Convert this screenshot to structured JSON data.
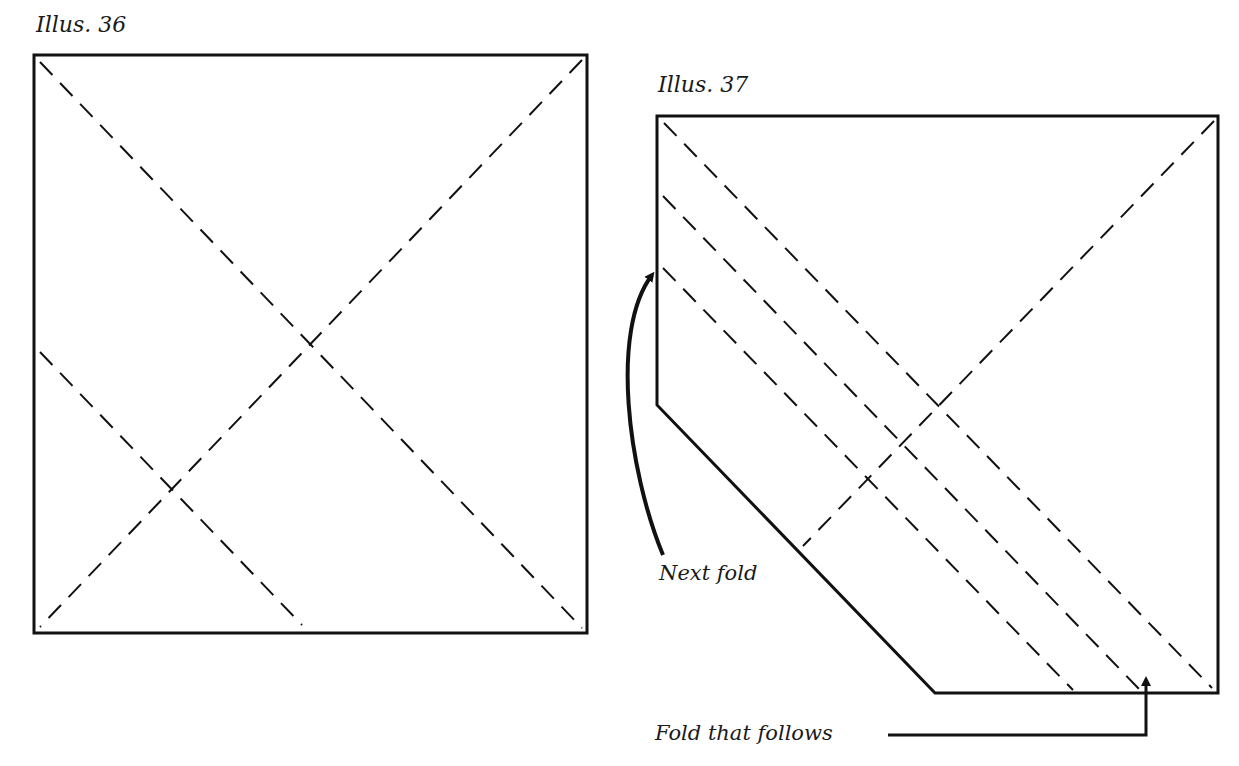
{
  "figures": [
    {
      "id": "illus-36",
      "title": "Illus. 36",
      "shape": "square",
      "outline": [
        [
          34,
          55
        ],
        [
          587,
          55
        ],
        [
          587,
          633
        ],
        [
          34,
          633
        ]
      ],
      "fold_lines": [
        {
          "type": "dashed",
          "from": [
            40,
            62
          ],
          "to": [
            582,
            628
          ]
        },
        {
          "type": "dashed",
          "from": [
            582,
            60
          ],
          "to": [
            40,
            627
          ]
        },
        {
          "type": "dashed",
          "from": [
            40,
            352
          ],
          "to": [
            302,
            625
          ]
        }
      ]
    },
    {
      "id": "illus-37",
      "title": "Illus. 37",
      "shape": "pentagon (square with folded corner)",
      "outline": [
        [
          657,
          116
        ],
        [
          1218,
          116
        ],
        [
          1218,
          693
        ],
        [
          935,
          693
        ],
        [
          657,
          405
        ]
      ],
      "fold_lines": [
        {
          "type": "dashed",
          "from": [
            664,
            123
          ],
          "to": [
            1212,
            688
          ]
        },
        {
          "type": "dashed",
          "from": [
            1214,
            121
          ],
          "to": [
            803,
            546
          ]
        },
        {
          "type": "dashed",
          "from": [
            663,
            196
          ],
          "to": [
            1140,
            690
          ]
        },
        {
          "type": "dashed",
          "from": [
            663,
            268
          ],
          "to": [
            1073,
            690
          ]
        }
      ],
      "annotations": [
        {
          "label": "Next fold",
          "arrow_target": [
            657,
            270
          ]
        },
        {
          "label": "Fold that follows",
          "arrow_target": [
            1145,
            672
          ]
        }
      ]
    }
  ],
  "style": {
    "line_color": "#111111",
    "background": "#ffffff"
  }
}
